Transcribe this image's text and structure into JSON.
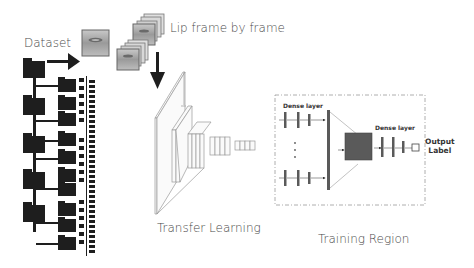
{
  "diagram": {
    "labels": {
      "dataset": "Dataset",
      "lip_frames": "Lip frame by frame",
      "transfer_learning": "Transfer Learning",
      "training_region": "Training Region",
      "dense_layer_left": "Dense layer",
      "dense_layer_right": "Dense layer",
      "output_label_line1": "Output",
      "output_label_line2": "Label"
    },
    "colors": {
      "dark": "#1e1e1e",
      "gray_block": "#5a5a5a",
      "text": "#4a4a4a",
      "dashed_border": "#999999"
    }
  }
}
